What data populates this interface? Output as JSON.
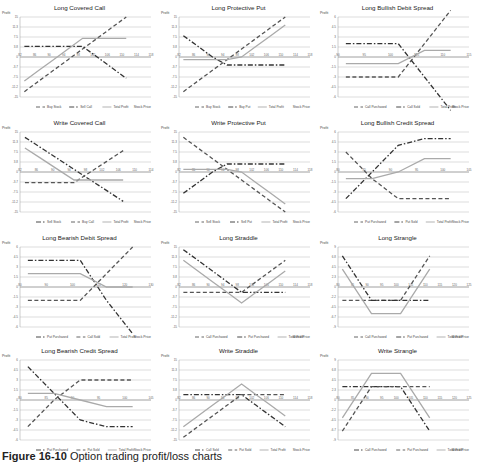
{
  "caption": {
    "label": "Figure 16-10",
    "text": "Option trading profit/loss charts"
  },
  "common": {
    "ylabel": "Profit",
    "xlabel": "Stock Price"
  },
  "chart_data": [
    {
      "type": "line",
      "title": "Long Covered Call",
      "ylabel": "Profit",
      "xlabel": "Stock Price",
      "x": [
        82,
        86,
        90,
        94,
        98,
        102,
        106,
        110,
        114,
        118
      ],
      "ylim": [
        -15,
        15
      ],
      "series": [
        {
          "name": "Buy Stock",
          "style": "dashed",
          "values": [
            -13,
            -9,
            -5,
            -1,
            3,
            7,
            11,
            15
          ]
        },
        {
          "name": "Sell Call",
          "style": "dashdot",
          "values": [
            4,
            4,
            4,
            4,
            4,
            0,
            -4,
            -8
          ]
        },
        {
          "name": "Total Profit",
          "style": "solid",
          "values": [
            -9,
            -5,
            -1,
            3,
            7,
            7,
            7,
            7
          ]
        }
      ]
    },
    {
      "type": "line",
      "title": "Long Protective Put",
      "ylabel": "Profit",
      "xlabel": "Stock Price",
      "x": [
        82,
        86,
        90,
        94,
        98,
        102,
        106,
        110,
        114,
        118
      ],
      "ylim": [
        -15,
        15
      ],
      "series": [
        {
          "name": "Buy Stock",
          "style": "dashed",
          "values": [
            -13,
            -9,
            -5,
            -1,
            3,
            7,
            11,
            15
          ]
        },
        {
          "name": "Buy Put",
          "style": "dashdot",
          "values": [
            8,
            4,
            0,
            -3,
            -3,
            -3,
            -3,
            -3
          ]
        },
        {
          "name": "Total Profit",
          "style": "solid",
          "values": [
            -1,
            -1,
            -1,
            -1,
            0,
            4,
            8,
            12
          ]
        }
      ]
    },
    {
      "type": "line",
      "title": "Long Bullish Debit Spread",
      "ylabel": "Profit",
      "xlabel": "Stock Price",
      "x": [
        90,
        95,
        100,
        105,
        110,
        115
      ],
      "ylim": [
        -6,
        6
      ],
      "series": [
        {
          "name": "Call Purchased",
          "style": "dashed",
          "values": [
            -3,
            -3,
            -3,
            2,
            7
          ]
        },
        {
          "name": "Call Sold",
          "style": "dashdot",
          "values": [
            2,
            2,
            2,
            -3,
            -8
          ]
        },
        {
          "name": "Total Profit",
          "style": "solid",
          "values": [
            -1,
            -1,
            -1,
            1,
            1
          ]
        }
      ]
    },
    {
      "type": "line",
      "title": "Write Covered Call",
      "ylabel": "Profit",
      "xlabel": "Stock Price",
      "x": [
        82,
        86,
        90,
        94,
        98,
        102,
        106,
        110,
        114
      ],
      "ylim": [
        -15,
        15
      ],
      "series": [
        {
          "name": "Sell Stock",
          "style": "dashdot",
          "values": [
            13,
            9,
            5,
            1,
            -3,
            -7,
            -11
          ]
        },
        {
          "name": "Buy Call",
          "style": "dashed",
          "values": [
            -4,
            -4,
            -4,
            -4,
            0,
            4,
            8
          ]
        },
        {
          "name": "Total Profit",
          "style": "solid",
          "values": [
            9,
            5,
            1,
            -3,
            -3,
            -3,
            -3
          ]
        }
      ]
    },
    {
      "type": "line",
      "title": "Write Protective Put",
      "ylabel": "Profit",
      "xlabel": "Stock Price",
      "x": [
        82,
        86,
        90,
        94,
        98,
        102,
        106,
        110,
        114,
        118
      ],
      "ylim": [
        -15,
        15
      ],
      "series": [
        {
          "name": "Sell Stock",
          "style": "dashed",
          "values": [
            13,
            9,
            5,
            1,
            -3,
            -7,
            -11,
            -15
          ]
        },
        {
          "name": "Sell Put",
          "style": "dashdot",
          "values": [
            -8,
            -4,
            0,
            3,
            3,
            3,
            3,
            3
          ]
        },
        {
          "name": "Total Profit",
          "style": "solid",
          "values": [
            1,
            1,
            1,
            1,
            0,
            -4,
            -8,
            -12
          ]
        }
      ]
    },
    {
      "type": "line",
      "title": "Long Bullish Credit Spread",
      "ylabel": "Profit",
      "xlabel": "Stock Price",
      "x": [
        80,
        85,
        90,
        95,
        100,
        105
      ],
      "ylim": [
        -6,
        6
      ],
      "series": [
        {
          "name": "Put Purchased",
          "style": "dashed",
          "values": [
            3,
            -1,
            -4,
            -4,
            -4
          ]
        },
        {
          "name": "Put Sold",
          "style": "dashdot",
          "values": [
            -4,
            0,
            4,
            5,
            5
          ]
        },
        {
          "name": "Total Profit",
          "style": "solid",
          "values": [
            -1,
            -1,
            0,
            2,
            2
          ]
        }
      ]
    },
    {
      "type": "line",
      "title": "Long Bearish Debit Spread",
      "ylabel": "Profit",
      "xlabel": "Stock Price",
      "x": [
        80,
        90,
        100,
        110,
        120,
        130
      ],
      "ylim": [
        -6,
        6
      ],
      "series": [
        {
          "name": "Put Purchased",
          "style": "dashdot",
          "values": [
            4,
            4,
            4,
            -2,
            -7
          ]
        },
        {
          "name": "Call Sold",
          "style": "dashed",
          "values": [
            -2,
            -2,
            -2,
            2,
            6
          ]
        },
        {
          "name": "Total Profit",
          "style": "solid",
          "values": [
            2,
            2,
            2,
            0,
            0
          ]
        }
      ]
    },
    {
      "type": "line",
      "title": "Long Straddle",
      "ylabel": "Profit",
      "xlabel": "Stock Price",
      "x": [
        82,
        86,
        90,
        94,
        98,
        102,
        106,
        110,
        114,
        118
      ],
      "ylim": [
        -15,
        15
      ],
      "series": [
        {
          "name": "Call Purchased",
          "style": "dashed",
          "values": [
            -2,
            -2,
            -2,
            -2,
            -2,
            2,
            6,
            10
          ]
        },
        {
          "name": "Put Purchased",
          "style": "dashdot",
          "values": [
            14,
            10,
            6,
            2,
            -2,
            -2,
            -2,
            -2
          ]
        },
        {
          "name": "Total Profit",
          "style": "solid",
          "values": [
            10,
            6,
            2,
            -2,
            -6,
            -2,
            2,
            6
          ]
        }
      ]
    },
    {
      "type": "line",
      "title": "Long Strangle",
      "ylabel": "Profit",
      "xlabel": "Stock Price",
      "x": [
        80,
        85,
        90,
        95,
        100,
        105,
        110,
        115,
        120,
        125
      ],
      "ylim": [
        -9,
        9
      ],
      "series": [
        {
          "name": "Call Purchased",
          "style": "dashed",
          "values": [
            -3,
            -3,
            -3,
            -3,
            -3,
            2,
            7
          ]
        },
        {
          "name": "Put Purchased",
          "style": "dashdot",
          "values": [
            7,
            2,
            -3,
            -3,
            -3,
            -3,
            -3
          ]
        },
        {
          "name": "Total Profit",
          "style": "solid",
          "values": [
            4,
            -1,
            -6,
            -6,
            -6,
            -1,
            4
          ]
        }
      ]
    },
    {
      "type": "line",
      "title": "Long Bearish Credit Spread",
      "ylabel": "Profit",
      "xlabel": "Stock Price",
      "x": [
        80,
        85,
        90,
        95,
        100,
        105
      ],
      "ylim": [
        -6,
        6
      ],
      "series": [
        {
          "name": "Put Purchased",
          "style": "dashdot",
          "values": [
            5,
            1,
            -3,
            -4,
            -4
          ]
        },
        {
          "name": "Put Sold",
          "style": "dashed",
          "values": [
            -4,
            0,
            3,
            3,
            3
          ]
        },
        {
          "name": "Total Profit",
          "style": "solid",
          "values": [
            1,
            1,
            0,
            -1,
            -1
          ]
        }
      ]
    },
    {
      "type": "line",
      "title": "Write Straddle",
      "ylabel": "Profit",
      "xlabel": "Stock Price",
      "x": [
        82,
        86,
        90,
        94,
        98,
        102,
        106,
        110,
        114,
        118
      ],
      "ylim": [
        -15,
        15
      ],
      "series": [
        {
          "name": "Call Sold",
          "style": "dashdot",
          "values": [
            2,
            2,
            2,
            2,
            2,
            -2,
            -6,
            -10
          ]
        },
        {
          "name": "Put Sold",
          "style": "dashed",
          "values": [
            -14,
            -10,
            -6,
            -2,
            2,
            2,
            2,
            2
          ]
        },
        {
          "name": "Total Profit",
          "style": "solid",
          "values": [
            -10,
            -6,
            -2,
            2,
            6,
            2,
            -2,
            -6
          ]
        }
      ]
    },
    {
      "type": "line",
      "title": "Write Strangle",
      "ylabel": "Profit",
      "xlabel": "Stock Price",
      "x": [
        80,
        85,
        90,
        95,
        100,
        105,
        110,
        115,
        120,
        125
      ],
      "ylim": [
        -9,
        9
      ],
      "series": [
        {
          "name": "Call Purchased",
          "style": "dashdot",
          "values": [
            3,
            3,
            3,
            3,
            3,
            -2,
            -7
          ]
        },
        {
          "name": "Put Purchased",
          "style": "dashed",
          "values": [
            -7,
            -2,
            3,
            3,
            3,
            3,
            3
          ]
        },
        {
          "name": "Total Profit",
          "style": "solid",
          "values": [
            -4,
            1,
            6,
            6,
            6,
            1,
            -4
          ]
        }
      ]
    }
  ]
}
